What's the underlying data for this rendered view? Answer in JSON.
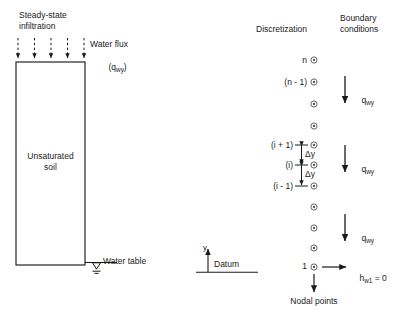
{
  "figure": {
    "left_panel": {
      "infiltration_label": "Steady-state\ninfiltration",
      "flux_label": "Water flux",
      "flux_symbol": "(q",
      "flux_symbol_sub": "wy",
      "flux_symbol_close": ")",
      "soil_label": "Unsaturated\nsoil",
      "water_table_label": "Water table",
      "arrow_count": 5
    },
    "axis": {
      "y_label": "y",
      "datum_label": "Datum"
    },
    "right_panel": {
      "col1_header": "Discretization",
      "col2_header": "Boundary\nconditions",
      "nodal_points_label": "Nodal points",
      "delta_y_label": "Δy",
      "head_label": "h",
      "head_sub": "w1",
      "head_value": " = 0",
      "flux_label": "q",
      "flux_sub": "wy",
      "node_labels": [
        "n",
        "(n - 1)",
        "(i + 1)",
        "(i)",
        "(i - 1)",
        "1"
      ],
      "node_count": 13
    },
    "colors": {
      "line": "#1a1a1a",
      "node": "#555555",
      "background": "#ffffff"
    }
  }
}
